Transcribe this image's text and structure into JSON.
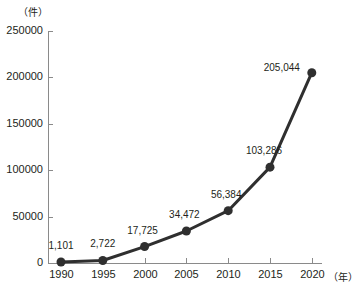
{
  "chart_data": {
    "type": "line",
    "title": "",
    "subtitle": "",
    "xlabel": "（年）",
    "ylabel": "（件）",
    "x": [
      1990,
      1995,
      2000,
      2005,
      2010,
      2015,
      2020
    ],
    "categories": [
      "1990",
      "1995",
      "2000",
      "2005",
      "2010",
      "2015",
      "2020"
    ],
    "values": [
      1101,
      2722,
      17725,
      34472,
      56384,
      103286,
      205044
    ],
    "point_labels": [
      "1,101",
      "2,722",
      "17,725",
      "34,472",
      "56,384",
      "103,286",
      "205,044"
    ],
    "series": [
      {
        "name": "件数",
        "values": [
          1101,
          2722,
          17725,
          34472,
          56384,
          103286,
          205044
        ],
        "color": "#2f2f2f"
      }
    ],
    "ylim": [
      0,
      250000
    ],
    "ytick_values": [
      0,
      50000,
      100000,
      150000,
      200000,
      250000
    ],
    "ytick_labels": [
      "0",
      "50000",
      "100000",
      "150000",
      "200000",
      "250000"
    ],
    "xtick_labels": [
      "1990",
      "1995",
      "2000",
      "2005",
      "2010",
      "2015",
      "2020"
    ],
    "grid": false,
    "legend": false,
    "legend_position": "none",
    "axis_color": "#8a8a8a",
    "text_color": "#231f20",
    "background": "#ffffff"
  },
  "layout": {
    "plot_left": 48,
    "plot_right": 322,
    "plot_top": 31,
    "plot_bottom": 263,
    "x_first_tick": 61,
    "x_tick_step": 41.8,
    "tick_length": 5,
    "marker_radius": 4.5,
    "y_unit_x": 33,
    "y_unit_y": 16,
    "x_unit_x": 328,
    "x_unit_y": 281
  },
  "point_label_offsets": [
    {
      "dx": 0,
      "dy": -13
    },
    {
      "dx": 0,
      "dy": -13
    },
    {
      "dx": -2,
      "dy": -13
    },
    {
      "dx": -2,
      "dy": -13
    },
    {
      "dx": -2,
      "dy": -13
    },
    {
      "dx": -6,
      "dy": -13
    },
    {
      "dx": -30,
      "dy": -2
    }
  ]
}
